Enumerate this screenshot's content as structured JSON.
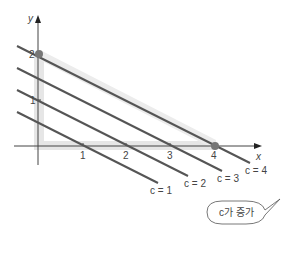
{
  "axes": {
    "x_label": "x",
    "y_label": "y",
    "x_ticks": [
      "1",
      "2",
      "3",
      "4"
    ],
    "y_ticks": [
      "1",
      "2"
    ]
  },
  "lines": [
    {
      "label": "c = 1",
      "c": 1
    },
    {
      "label": "c = 2",
      "c": 2
    },
    {
      "label": "c = 3",
      "c": 3
    },
    {
      "label": "c = 4",
      "c": 4
    }
  ],
  "points": [
    {
      "name": "y-intercept",
      "x": 0,
      "y": 2
    },
    {
      "name": "x-intercept",
      "x": 4,
      "y": 0
    }
  ],
  "callout": {
    "text": "c가 증가"
  },
  "colors": {
    "line": "#555555",
    "shade": "#e6e6e6",
    "point": "#777777",
    "axis": "#444444"
  }
}
